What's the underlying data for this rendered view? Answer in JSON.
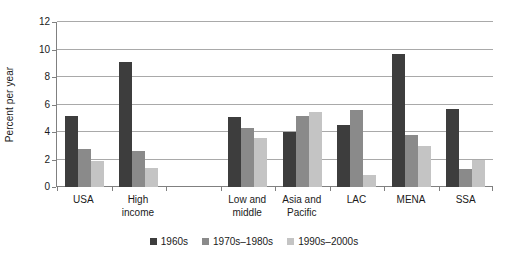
{
  "chart_data": {
    "type": "bar",
    "title": "",
    "xlabel": "",
    "ylabel": "Percent per year",
    "ylim": [
      0,
      12
    ],
    "yticks": [
      0,
      2,
      4,
      6,
      8,
      10,
      12
    ],
    "ytick_labels": [
      "0",
      "2",
      "4",
      "6",
      "8",
      "10",
      "12"
    ],
    "grid": true,
    "legend_position": "bottom",
    "categories": [
      "USA",
      "High\nincome",
      "",
      "Low and\nmiddle",
      "Asia and\nPacific",
      "LAC",
      "MENA",
      "SSA"
    ],
    "series": [
      {
        "name": "1960s",
        "color": "#3d3d3d",
        "values": [
          5.2,
          9.1,
          null,
          5.1,
          4.0,
          4.5,
          9.7,
          5.7
        ]
      },
      {
        "name": "1970s–1980s",
        "color": "#8a8a8a",
        "values": [
          2.8,
          2.65,
          null,
          4.3,
          5.2,
          5.6,
          3.8,
          1.3
        ]
      },
      {
        "name": "1990s–2000s",
        "color": "#c4c4c4",
        "values": [
          1.9,
          1.35,
          null,
          3.6,
          5.45,
          0.85,
          3.0,
          2.0
        ]
      }
    ]
  },
  "legend": {
    "items": [
      {
        "label": "1960s",
        "color": "#3d3d3d"
      },
      {
        "label": "1970s–1980s",
        "color": "#8a8a8a"
      },
      {
        "label": "1990s–2000s",
        "color": "#c4c4c4"
      }
    ]
  }
}
